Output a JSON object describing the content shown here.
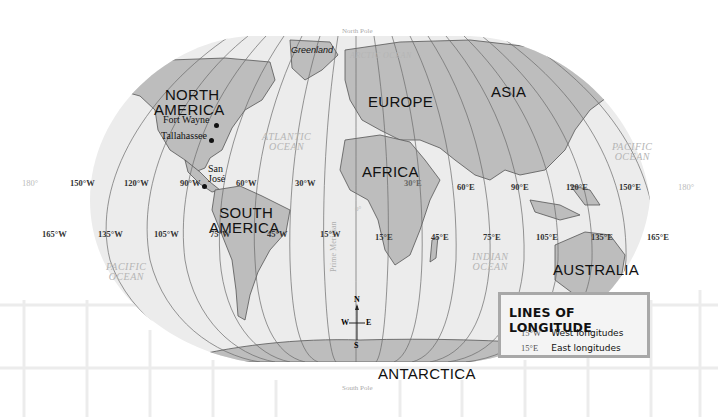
{
  "map": {
    "title": "Lines of Longitude",
    "poles": {
      "north": "North Pole",
      "south": "South Pole"
    },
    "continents": [
      {
        "name": "NORTH\nAMERICA",
        "line1": "NORTH",
        "line2": "AMERICA"
      },
      {
        "name": "SOUTH AMERICA",
        "line1": "SOUTH",
        "line2": "AMERICA"
      },
      {
        "name": "EUROPE"
      },
      {
        "name": "ASIA"
      },
      {
        "name": "AFRICA"
      },
      {
        "name": "AUSTRALIA"
      },
      {
        "name": "ANTARCTICA"
      }
    ],
    "regions": {
      "greenland": "Greenland"
    },
    "oceans": {
      "arctic": "ARCTIC OCEAN",
      "atlantic": [
        "ATLANTIC",
        "OCEAN"
      ],
      "pacific_east": [
        "PACIFIC",
        "OCEAN"
      ],
      "pacific_west": [
        "PACIFIC",
        "OCEAN"
      ],
      "indian": [
        "INDIAN",
        "OCEAN"
      ]
    },
    "cities": [
      {
        "name": "Fort Wayne"
      },
      {
        "name": "Tallahassee"
      },
      {
        "name": "San",
        "name2": "José"
      }
    ],
    "prime_meridian_label": "Prime Meridian",
    "zero_label": "0°",
    "longitude_labels_upper": [
      "180°",
      "150°W",
      "120°W",
      "90°W",
      "60°W",
      "30°W",
      "30°E",
      "60°E",
      "90°E",
      "120°E",
      "150°E",
      "180°"
    ],
    "longitude_labels_lower": [
      "165°W",
      "135°W",
      "105°W",
      "75°W",
      "45°W",
      "15°W",
      "15°E",
      "45°E",
      "75°E",
      "105°E",
      "135°E",
      "165°E"
    ],
    "compass": {
      "n": "N",
      "s": "S",
      "e": "E",
      "w": "W"
    }
  },
  "legend": {
    "title": "LINES OF LONGITUDE",
    "items": [
      {
        "code": "15°W",
        "label": "West longitudes"
      },
      {
        "code": "15°E",
        "label": "East longitudes"
      }
    ]
  },
  "colors": {
    "ocean": "#ececec",
    "land": "#bdbdbd",
    "border": "#555555",
    "meridian": "#6a6a6a",
    "legend_border": "#a8a8a8"
  }
}
